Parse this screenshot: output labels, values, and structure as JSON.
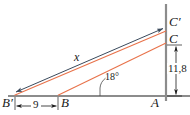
{
  "figure": {
    "width": 190,
    "height": 115,
    "background": "#ffffff"
  },
  "colors": {
    "axis": "#8c8c8c",
    "sight_line_primary": "#e8724a",
    "sight_line_secondary": "#e8724a",
    "measure_line": "#3a4a5c",
    "label_text": "#1a1a1a",
    "dimension_line": "#1a1a1a",
    "angle_arc": "#4a4a4a"
  },
  "points": [
    {
      "id": "B-prime",
      "label": "B′",
      "x": 14,
      "y": 96,
      "label_x": 3,
      "label_y": 99
    },
    {
      "id": "B",
      "label": "B",
      "x": 58,
      "y": 96,
      "label_x": 60,
      "label_y": 99
    },
    {
      "id": "A",
      "label": "A",
      "x": 166,
      "y": 96,
      "label_x": 152,
      "label_y": 99
    },
    {
      "id": "C",
      "label": "C",
      "x": 166,
      "y": 43,
      "label_x": 169,
      "label_y": 33
    },
    {
      "id": "C-prime",
      "label": "C′",
      "x": 166,
      "y": 28,
      "label_x": 169,
      "label_y": 17
    }
  ],
  "segments": [
    {
      "id": "baseline",
      "from": "B-prime-extended",
      "to": "A-extended",
      "color": "axis"
    },
    {
      "id": "vertical-axis",
      "from": "top",
      "to": "A-extended",
      "color": "axis"
    },
    {
      "id": "sight-line-lower",
      "from": "B",
      "to": "C",
      "color": "sight_line_secondary"
    },
    {
      "id": "sight-line-upper",
      "from": "B-prime",
      "to": "C-prime",
      "color": "sight_line_primary"
    },
    {
      "id": "distance-x",
      "from": "B-prime",
      "to": "C-prime",
      "color": "measure_line",
      "arrows": "both"
    }
  ],
  "labels": {
    "distance_x": "x",
    "base_distance": "9",
    "height": "11,8",
    "angle": "18°"
  },
  "dimensions": [
    {
      "id": "horizontal-9",
      "value": "9",
      "orientation": "horizontal",
      "from_x": 16,
      "to_x": 57,
      "y": 106,
      "label_x": 32,
      "label_y": 101
    },
    {
      "id": "vertical-11-8",
      "value": "11,8",
      "orientation": "vertical",
      "x": 176,
      "from_y": 46,
      "to_y": 95,
      "label_x": 169,
      "label_y": 64
    }
  ],
  "angle_marker": {
    "id": "angle-18",
    "value": "18°",
    "vertex_x": 100,
    "vertex_y": 96,
    "label_x": 106,
    "label_y": 77
  }
}
